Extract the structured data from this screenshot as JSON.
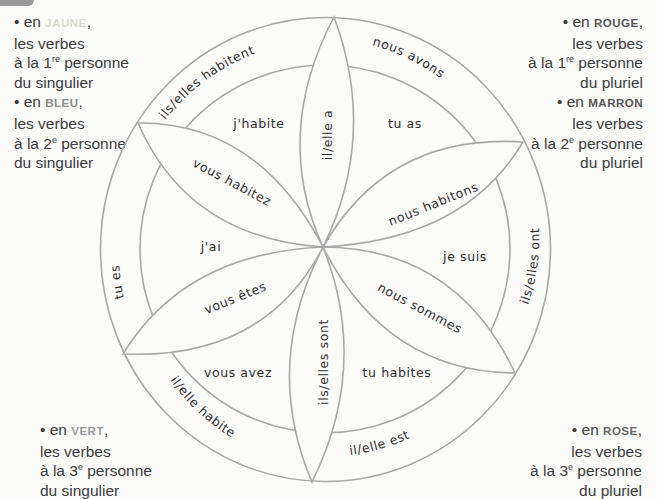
{
  "legend": {
    "top_left": [
      {
        "bullet": "• en ",
        "keyword": "JAUNE",
        "keyword_color": "#d9d9d0",
        "after": ",",
        "line2": "les verbes",
        "line3_pre": "à la 1",
        "line3_sup": "re",
        "line3_post": " personne",
        "line4": "du singulier"
      },
      {
        "bullet": "• en ",
        "keyword": "BLEU",
        "keyword_color": "#8a8a8a",
        "after": ",",
        "line2": "les verbes",
        "line3_pre": "à la 2",
        "line3_sup": "e",
        "line3_post": " personne",
        "line4": "du singulier"
      }
    ],
    "top_right": [
      {
        "bullet": "• en ",
        "keyword": "ROUGE",
        "keyword_color": "#555555",
        "after": ",",
        "line2": "les verbes",
        "line3_pre": "à la 1",
        "line3_sup": "re",
        "line3_post": " personne",
        "line4": "du pluriel"
      },
      {
        "bullet": "• en ",
        "keyword": "MARRON",
        "keyword_color": "#555555",
        "after": "",
        "line2": "les verbes",
        "line3_pre": "à la 2",
        "line3_sup": "e",
        "line3_post": " personne",
        "line4": "du pluriel"
      }
    ],
    "bottom_left": [
      {
        "bullet": "• en ",
        "keyword": "VERT",
        "keyword_color": "#9a9a9a",
        "after": ",",
        "line2": "les verbes",
        "line3_pre": "à la 3",
        "line3_sup": "e",
        "line3_post": " personne",
        "line4": "du singulier"
      }
    ],
    "bottom_right": [
      {
        "bullet": "• en ",
        "keyword": "ROSE",
        "keyword_color": "#666666",
        "after": ",",
        "line2": "les verbes",
        "line3_pre": "à la 3",
        "line3_sup": "e",
        "line3_post": " personne",
        "line4": "du pluriel"
      }
    ]
  },
  "diagram": {
    "stroke_color": "#a8a8a8",
    "outer_ring": {
      "ils_elles_habitent": "ils/elles habitent",
      "nous_avons": "nous avons",
      "ils_elles_ont": "ils/elles ont",
      "il_elle_est": "il/elle est",
      "il_elle_habite": "il/elle habite",
      "tu_es": "tu es"
    },
    "petals": {
      "il_elle_a": "il/elle a",
      "nous_habitons": "nous habitons",
      "nous_sommes": "nous sommes",
      "ils_elles_sont": "ils/elles sont",
      "vous_etes": "vous êtes",
      "vous_habitez": "vous habitez"
    },
    "inner_sectors": {
      "j_habite": "j'habite",
      "tu_as": "tu as",
      "je_suis": "je suis",
      "tu_habites": "tu habites",
      "vous_avez": "vous avez",
      "j_ai": "j'ai"
    }
  }
}
